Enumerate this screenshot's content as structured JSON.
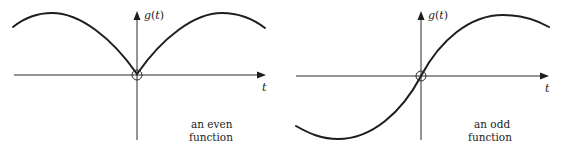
{
  "panels": [
    {
      "id": "even",
      "y_axis_label": "g(t)",
      "y_axis_label_parts": {
        "func": "g",
        "open": "(",
        "var": "t",
        "close": ")"
      },
      "x_axis_label": "t",
      "caption_line1": "an even",
      "caption_line2": "function"
    },
    {
      "id": "odd",
      "y_axis_label": "g(t)",
      "y_axis_label_parts": {
        "func": "g",
        "open": "(",
        "var": "t",
        "close": ")"
      },
      "x_axis_label": "t",
      "caption_line1": "an odd",
      "caption_line2": "function"
    }
  ],
  "colors": {
    "curve": "#1e1e1e",
    "axis": "#2a2a2a",
    "background": "#ffffff"
  }
}
